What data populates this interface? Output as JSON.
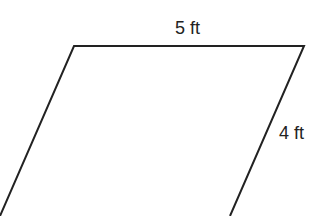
{
  "diagram": {
    "shape": "parallelogram",
    "labels": {
      "top": "5 ft",
      "right": "4 ft"
    },
    "stroke_color": "#222222"
  }
}
